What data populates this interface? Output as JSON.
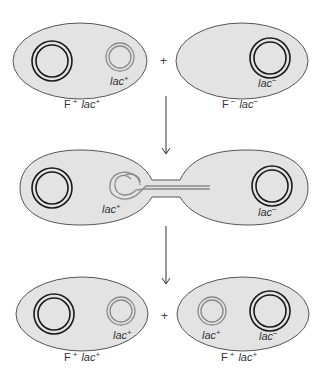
{
  "diagram": {
    "stages": [
      {
        "name": "before-conjugation",
        "cells": [
          {
            "genotype_label": "F",
            "genotype_f_sup": "+",
            "genotype_lac": "lac",
            "genotype_lac_sup": "+",
            "plasmid_label": "lac",
            "plasmid_sup": "+",
            "chromosome_label": ""
          },
          {
            "genotype_label": "F",
            "genotype_f_sup": "−",
            "genotype_lac": "lac",
            "genotype_lac_sup": "−",
            "chromosome_label": "lac",
            "chromosome_sup": "−"
          }
        ],
        "operator": "+"
      },
      {
        "name": "conjugation",
        "cells": [
          {
            "plasmid_label": "lac",
            "plasmid_sup": "+"
          },
          {
            "chromosome_label": "lac",
            "chromosome_sup": "−"
          }
        ]
      },
      {
        "name": "after-conjugation",
        "cells": [
          {
            "genotype_label": "F",
            "genotype_f_sup": "+",
            "genotype_lac": "lac",
            "genotype_lac_sup": "+",
            "plasmid_label": "lac",
            "plasmid_sup": "+"
          },
          {
            "genotype_label": "F",
            "genotype_f_sup": "+",
            "genotype_lac": "lac",
            "genotype_lac_sup": "+",
            "plasmid_label": "lac",
            "plasmid_sup": "+",
            "chromosome_label": "lac",
            "chromosome_sup": "−"
          }
        ],
        "operator": "+"
      }
    ],
    "colors": {
      "cell_fill": "#e3e3e3",
      "chromosome": "#1a1a1a",
      "plasmid": "#8a8a8a"
    }
  }
}
